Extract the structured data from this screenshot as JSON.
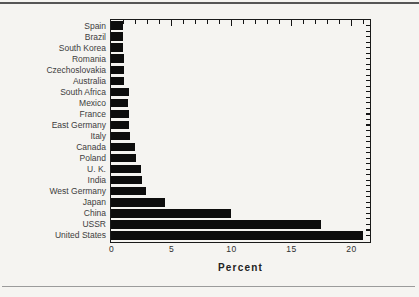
{
  "page": {
    "background_color": "#f5f4f1",
    "top_rule_color": "#565656",
    "bottom_rule_color": "#9b9b9b"
  },
  "chart_data": {
    "type": "bar",
    "orientation": "horizontal",
    "xlabel": "Percent",
    "categories": [
      "Spain",
      "Brazil",
      "South Korea",
      "Romania",
      "Czechoslovakia",
      "Australia",
      "South Africa",
      "Mexico",
      "France",
      "East Germany",
      "Italy",
      "Canada",
      "Poland",
      "U. K.",
      "India",
      "West Germany",
      "Japan",
      "China",
      "USSR",
      "United States"
    ],
    "values": [
      1.0,
      1.0,
      1.0,
      1.1,
      1.1,
      1.1,
      1.5,
      1.4,
      1.5,
      1.5,
      1.6,
      2.0,
      2.1,
      2.5,
      2.6,
      2.9,
      4.5,
      10.0,
      17.5,
      21.0
    ],
    "xlim": [
      0,
      21.5
    ],
    "xticks": [
      0,
      5,
      10,
      15,
      20
    ],
    "x_minor_tick_interval": 1,
    "bar_color": "#0d0d0d",
    "frame_color": "#1a1a1a",
    "text_color": "#3d3d3d",
    "grid": false,
    "legend": false
  }
}
